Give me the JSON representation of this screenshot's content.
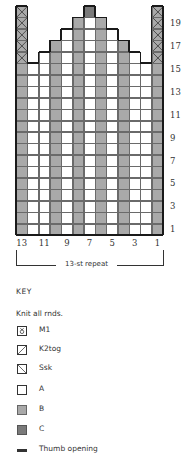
{
  "chart": {
    "columns": 13,
    "rows": 20,
    "row_labels": [
      "1",
      "3",
      "5",
      "7",
      "9",
      "11",
      "13",
      "15",
      "17",
      "19"
    ],
    "col_labels": [
      "13",
      "11",
      "9",
      "7",
      "5",
      "3",
      "1"
    ],
    "repeat_label": "13-st repeat",
    "column_colors_left_to_right": [
      "B",
      "A",
      "A",
      "B",
      "A",
      "B",
      "A",
      "B",
      "A",
      "B",
      "A",
      "A",
      "B"
    ],
    "shaping": {
      "row_16": {
        "from_col": 11,
        "to_col": 3
      },
      "row_17": {
        "from_col": 10,
        "to_col": 4
      },
      "row_18": {
        "from_col": 9,
        "to_col": 5
      },
      "row_19": {
        "from_col": 8,
        "to_col": 6
      },
      "row_20": {
        "from_col": 7,
        "to_col": 7,
        "color": "C"
      }
    },
    "thumb_opening": {
      "cols": [
        13,
        1
      ],
      "rows": [
        16,
        20
      ]
    }
  },
  "key": {
    "title": "KEY",
    "note": "Knit all rnds.",
    "items": [
      {
        "symbol": "m1-icon",
        "label": "M1"
      },
      {
        "symbol": "k2tog-icon",
        "label": "K2tog"
      },
      {
        "symbol": "ssk-icon",
        "label": "Ssk"
      },
      {
        "symbol": "color-a-swatch",
        "label": "A"
      },
      {
        "symbol": "color-b-swatch",
        "label": "B"
      },
      {
        "symbol": "color-c-swatch",
        "label": "C"
      },
      {
        "symbol": "thumb-opening-swatch",
        "label": "Thumb opening"
      }
    ]
  },
  "colors": {
    "A": "#ffffff",
    "B": "#a9a9a9",
    "C": "#7a7a7a",
    "outline": "#1a1a1a"
  }
}
